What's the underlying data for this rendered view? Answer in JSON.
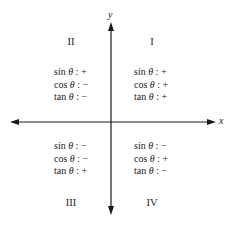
{
  "axes": {
    "x_label": "x",
    "y_label": "y",
    "color": "#1a1a1a"
  },
  "quadrants": [
    {
      "numeral": "I",
      "rows": [
        {
          "fn": "sin",
          "var": "θ",
          "sign": "+"
        },
        {
          "fn": "cos",
          "var": "θ",
          "sign": "+"
        },
        {
          "fn": "tan",
          "var": "θ",
          "sign": "+"
        }
      ]
    },
    {
      "numeral": "II",
      "rows": [
        {
          "fn": "sin",
          "var": "θ",
          "sign": "+"
        },
        {
          "fn": "cos",
          "var": "θ",
          "sign": "−"
        },
        {
          "fn": "tan",
          "var": "θ",
          "sign": "−"
        }
      ]
    },
    {
      "numeral": "III",
      "rows": [
        {
          "fn": "sin",
          "var": "θ",
          "sign": "−"
        },
        {
          "fn": "cos",
          "var": "θ",
          "sign": "−"
        },
        {
          "fn": "tan",
          "var": "θ",
          "sign": "+"
        }
      ]
    },
    {
      "numeral": "IV",
      "rows": [
        {
          "fn": "sin",
          "var": "θ",
          "sign": "−"
        },
        {
          "fn": "cos",
          "var": "θ",
          "sign": "+"
        },
        {
          "fn": "tan",
          "var": "θ",
          "sign": "−"
        }
      ]
    }
  ],
  "separator": ":"
}
